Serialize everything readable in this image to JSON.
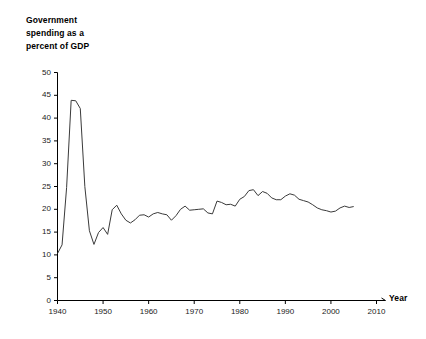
{
  "chart_data": {
    "type": "line",
    "title": "Government\nspending as a\npercent of GDP",
    "xlabel": "Year",
    "ylabel": "",
    "xlim": [
      1940,
      2010
    ],
    "ylim": [
      0,
      50
    ],
    "grid": false,
    "legend": null,
    "xticks": [
      "1940",
      "1950",
      "1960",
      "1970",
      "1980",
      "1990",
      "2000",
      "2010"
    ],
    "xtick_values": [
      1940,
      1950,
      1960,
      1970,
      1980,
      1990,
      2000,
      2010
    ],
    "yticks": [
      "0",
      "5",
      "10",
      "15",
      "20",
      "25",
      "30",
      "35",
      "40",
      "45",
      "50"
    ],
    "ytick_values": [
      0,
      5,
      10,
      15,
      20,
      25,
      30,
      35,
      40,
      45,
      50
    ],
    "line_color": "#3a3a3a",
    "series": [
      {
        "name": "Government spending as a percent of GDP",
        "x": [
          1940,
          1941,
          1942,
          1943,
          1944,
          1945,
          1946,
          1947,
          1948,
          1949,
          1950,
          1951,
          1952,
          1953,
          1954,
          1955,
          1956,
          1957,
          1958,
          1959,
          1960,
          1961,
          1962,
          1963,
          1964,
          1965,
          1966,
          1967,
          1968,
          1969,
          1970,
          1971,
          1972,
          1973,
          1974,
          1975,
          1976,
          1977,
          1978,
          1979,
          1980,
          1981,
          1982,
          1983,
          1984,
          1985,
          1986,
          1987,
          1988,
          1989,
          1990,
          1991,
          1992,
          1993,
          1994,
          1995,
          1996,
          1997,
          1998,
          1999,
          2000,
          2001,
          2002,
          2003,
          2004,
          2005
        ],
        "values": [
          10.3,
          12.2,
          24.8,
          43.9,
          43.8,
          42.1,
          25.0,
          15.3,
          12.3,
          14.9,
          16.0,
          14.5,
          19.9,
          20.9,
          19.0,
          17.6,
          17.0,
          17.7,
          18.7,
          18.8,
          18.3,
          19.0,
          19.3,
          19.0,
          18.8,
          17.6,
          18.6,
          20.0,
          20.7,
          19.8,
          19.9,
          20.0,
          20.1,
          19.2,
          19.0,
          21.8,
          21.5,
          21.0,
          21.1,
          20.7,
          22.2,
          22.8,
          24.1,
          24.3,
          23.0,
          23.9,
          23.5,
          22.5,
          22.1,
          22.1,
          22.9,
          23.4,
          23.1,
          22.2,
          21.9,
          21.6,
          21.0,
          20.3,
          19.9,
          19.7,
          19.4,
          19.6,
          20.3,
          20.7,
          20.4,
          20.6
        ]
      }
    ]
  }
}
